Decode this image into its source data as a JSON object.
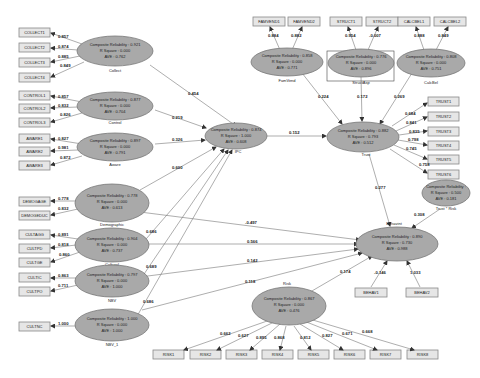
{
  "stat_labels": {
    "cr": "Composite Reliability :",
    "r2": "R Square :",
    "ave": "AVE :"
  },
  "latent_variables": [
    {
      "id": "collect",
      "name": "Collect",
      "cr": "0.921",
      "r2": "0.000",
      "ave": "0.762"
    },
    {
      "id": "control",
      "name": "Control",
      "cr": "0.877",
      "r2": "0.000",
      "ave": "0.704"
    },
    {
      "id": "aware",
      "name": "Aware",
      "cr": "0.897",
      "r2": "0.000",
      "ave": "0.791"
    },
    {
      "id": "demographic",
      "name": "Demographic",
      "cr": "0.778",
      "r2": "0.000",
      "ave": "0.613"
    },
    {
      "id": "cultural",
      "name": "Cultural",
      "cr": "0.904",
      "r2": "0.000",
      "ave": "0.737"
    },
    {
      "id": "nbv",
      "name": "NBV",
      "cr": "0.797",
      "r2": "0.000",
      "ave": "1.000"
    },
    {
      "id": "nbv1",
      "name": "NBV_1",
      "cr": "1.000",
      "r2": "0.000",
      "ave": "1.000"
    },
    {
      "id": "ipc",
      "name": "IPC",
      "cr": "0.874",
      "r2": "1.000",
      "ave": "0.608"
    },
    {
      "id": "famvend",
      "name": "FamVend",
      "cr": "0.858",
      "r2": "0.000",
      "ave": "0.771"
    },
    {
      "id": "structasp",
      "name": "StructAsp",
      "cr": "0.776",
      "r2": "0.000",
      "ave": "0.896"
    },
    {
      "id": "calcbel",
      "name": "CalcBel",
      "cr": "0.808",
      "r2": "0.000",
      "ave": "0.751"
    },
    {
      "id": "trust",
      "name": "Trust",
      "cr": "0.882",
      "r2": "0.793",
      "ave": "0.512"
    },
    {
      "id": "trustrisk",
      "name": "Trust * Risk",
      "cr": "",
      "r2": "0.500",
      "ave": "0.181"
    },
    {
      "id": "behavint",
      "name": "Behavint",
      "cr": "0.890",
      "r2": "0.730",
      "ave": "0.988"
    },
    {
      "id": "risk",
      "name": "Risk",
      "cr": "0.867",
      "r2": "0.000",
      "ave": "0.476"
    }
  ],
  "indicators": {
    "collect": [
      {
        "label": "COLLECT1",
        "loading": "0.857"
      },
      {
        "label": "COLLECT2",
        "loading": "0.874"
      },
      {
        "label": "COLLECT3",
        "loading": "0.885"
      },
      {
        "label": "COLLECT4",
        "loading": "0.849"
      }
    ],
    "control": [
      {
        "label": "CONTROL1",
        "loading": "0.857"
      },
      {
        "label": "CONTROL2",
        "loading": "0.832"
      },
      {
        "label": "CONTROL3",
        "loading": "0.826"
      }
    ],
    "aware": [
      {
        "label": "AWARE1",
        "loading": "0.827"
      },
      {
        "label": "AWARE2",
        "loading": "0.981"
      },
      {
        "label": "AWARE3",
        "loading": "0.872"
      }
    ],
    "demographic": [
      {
        "label": "DEMOGAGE",
        "loading": "0.778"
      },
      {
        "label": "DEMOGEDUC",
        "loading": "0.832"
      }
    ],
    "cultural": [
      {
        "label": "CULTAGG",
        "loading": "0.891"
      },
      {
        "label": "CULTPD",
        "loading": "0.818"
      },
      {
        "label": "CULTGE",
        "loading": "0.860"
      }
    ],
    "nbv": [
      {
        "label": "CULTIC",
        "loading": "0.863"
      },
      {
        "label": "CULTPO",
        "loading": "0.711"
      }
    ],
    "nbv1": [
      {
        "label": "CULTNC",
        "loading": "1.000"
      }
    ],
    "famvend": [
      {
        "label": "FAMVEND1",
        "loading": "0.884"
      },
      {
        "label": "FAMVEND2",
        "loading": "0.882"
      }
    ],
    "structasp": [
      {
        "label": "STRUCT1",
        "loading": "0.954"
      },
      {
        "label": "STRUCT2",
        "loading": "-0.007"
      }
    ],
    "calcbel": [
      {
        "label": "CALCBEL1",
        "loading": "0.888"
      },
      {
        "label": "CALCBEL2",
        "loading": "0.849"
      }
    ],
    "trust": [
      {
        "label": "TRUST1",
        "loading": "0.684"
      },
      {
        "label": "TRUST2",
        "loading": "0.841"
      },
      {
        "label": "TRUST3",
        "loading": "0.835"
      },
      {
        "label": "TRUST4",
        "loading": "0.798"
      },
      {
        "label": "TRUST5",
        "loading": "0.745"
      },
      {
        "label": "TRUST6",
        "loading": "0.758"
      }
    ],
    "behavint": [
      {
        "label": "BEHAV1",
        "loading": "-0.146"
      },
      {
        "label": "BEHAV2",
        "loading": "1.033"
      }
    ],
    "risk": [
      {
        "label": "RISK1",
        "loading": "0.662"
      },
      {
        "label": "RISK2",
        "loading": "0.627"
      },
      {
        "label": "RISK3",
        "loading": "0.895"
      },
      {
        "label": "RISK4",
        "loading": "0.868"
      },
      {
        "label": "RISK5",
        "loading": "0.812"
      },
      {
        "label": "RISK6",
        "loading": "0.827"
      },
      {
        "label": "RISK7",
        "loading": "0.671"
      },
      {
        "label": "RISK8",
        "loading": "0.668"
      }
    ]
  },
  "structural_paths": [
    {
      "from": "collect",
      "to": "ipc",
      "coef": "0.454"
    },
    {
      "from": "control",
      "to": "ipc",
      "coef": "0.219"
    },
    {
      "from": "aware",
      "to": "ipc",
      "coef": "0.326"
    },
    {
      "from": "demographic",
      "to": "ipc",
      "coef": "0.600"
    },
    {
      "from": "cultural",
      "to": "ipc",
      "coef": "0.686"
    },
    {
      "from": "nbv",
      "to": "ipc",
      "coef": "0.689"
    },
    {
      "from": "nbv1",
      "to": "ipc",
      "coef": "0.686"
    },
    {
      "from": "ipc",
      "to": "trust",
      "coef": "0.152"
    },
    {
      "from": "famvend",
      "to": "trust",
      "coef": "0.224"
    },
    {
      "from": "structasp",
      "to": "trust",
      "coef": "0.172"
    },
    {
      "from": "calcbel",
      "to": "trust",
      "coef": "0.269"
    },
    {
      "from": "trust",
      "to": "behavint",
      "coef": "0.277"
    },
    {
      "from": "trustrisk",
      "to": "behavint",
      "coef": "0.308"
    },
    {
      "from": "demographic",
      "to": "behavint",
      "coef": "-0.497"
    },
    {
      "from": "cultural",
      "to": "behavint",
      "coef": "0.566"
    },
    {
      "from": "nbv",
      "to": "behavint",
      "coef": "0.142"
    },
    {
      "from": "nbv1",
      "to": "behavint",
      "coef": "0.118"
    },
    {
      "from": "risk",
      "to": "behavint",
      "coef": "0.174"
    }
  ]
}
